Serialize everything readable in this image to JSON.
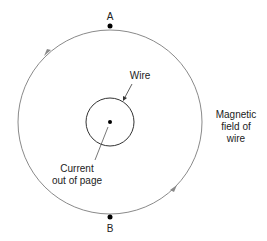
{
  "diagram": {
    "points": {
      "top": "A",
      "bottom": "B"
    },
    "wire_label": "Wire",
    "current_label": [
      "Current",
      "out of page"
    ],
    "field_label": [
      "Magnetic",
      "field of",
      "wire"
    ],
    "field_direction": "counterclockwise",
    "colors": {
      "field_circle": "#8a8a8a",
      "lines": "#333333",
      "dots": "#000000"
    }
  }
}
